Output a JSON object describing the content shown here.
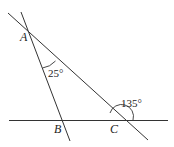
{
  "diagram": {
    "type": "geometry",
    "points": {
      "A": {
        "label": "A"
      },
      "B": {
        "label": "B"
      },
      "C": {
        "label": "C"
      }
    },
    "angles": {
      "angle_at_A": {
        "label": "25°"
      },
      "exterior_at_C": {
        "label": "135°"
      }
    },
    "colors": {
      "stroke": "#333333",
      "text": "#222222",
      "background": "#ffffff"
    }
  }
}
